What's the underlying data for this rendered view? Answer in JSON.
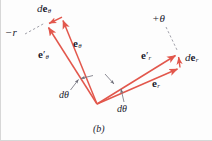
{
  "figure": {
    "caption": "(b)",
    "background_color": "#fdfdfd",
    "vector_color": "#e2574c",
    "label_color": "#1b1b2e",
    "leader_color": "#7a7a86",
    "labels": {
      "d_e_theta": {
        "d": "d",
        "vec": "e",
        "sub": "θ"
      },
      "e_theta_prime": {
        "vec": "e",
        "prime": "′",
        "sub": "θ"
      },
      "e_theta": {
        "vec": "e",
        "sub": "θ"
      },
      "minus_r": "−r",
      "plus_theta": "+θ",
      "e_r_prime": {
        "vec": "e",
        "prime": "′",
        "sub": "r"
      },
      "e_r": {
        "vec": "e",
        "sub": "r"
      },
      "d_e_r": {
        "d": "d",
        "vec": "e",
        "sub": "r"
      },
      "d_theta_left": "dθ",
      "d_theta_right": "dθ"
    }
  },
  "geometry": {
    "vertex": {
      "x": 97,
      "y": 104
    },
    "vectors": [
      {
        "name": "e-theta-prime",
        "x1": 97,
        "y1": 104,
        "x2": 46.5,
        "y2": 24.5
      },
      {
        "name": "e-theta",
        "x1": 97,
        "y1": 104,
        "x2": 61.5,
        "y2": 17.5
      },
      {
        "name": "d-e-theta",
        "x1": 61.5,
        "y1": 17.5,
        "x2": 47.5,
        "y2": 24.0
      },
      {
        "name": "e-r-prime",
        "x1": 97,
        "y1": 104,
        "x2": 178.5,
        "y2": 53.5
      },
      {
        "name": "e-r",
        "x1": 97,
        "y1": 104,
        "x2": 180.5,
        "y2": 67.5
      },
      {
        "name": "d-e-r",
        "x1": 180.0,
        "y1": 67.0,
        "x2": 178.5,
        "y2": 54.5
      }
    ],
    "leaders": [
      {
        "name": "minus-r-leader",
        "x1": 24,
        "y1": 34,
        "x2": 45,
        "y2": 23,
        "style": "dashed"
      },
      {
        "name": "plus-theta-leader",
        "x1": 167,
        "y1": 26,
        "x2": 178,
        "y2": 50,
        "style": "dashed"
      },
      {
        "name": "d-theta-left-leader",
        "x1": 71,
        "y1": 89,
        "x2": 79,
        "y2": 79,
        "style": "solid"
      },
      {
        "name": "d-theta-left-inner-leader",
        "x1": 92,
        "y1": 76,
        "x2": 80,
        "y2": 79,
        "style": "solid"
      },
      {
        "name": "d-theta-right-leader",
        "x1": 124,
        "y1": 101,
        "x2": 121,
        "y2": 87,
        "style": "solid"
      },
      {
        "name": "d-theta-right-inner-leader",
        "x1": 106,
        "y1": 75,
        "x2": 114,
        "y2": 84,
        "style": "solid"
      }
    ]
  }
}
